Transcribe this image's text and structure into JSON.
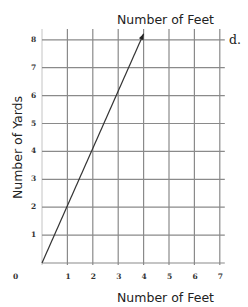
{
  "problem_label": "d.",
  "chart_data": {
    "type": "line",
    "title": "Number of Feet",
    "xlabel": "Number of Feet",
    "ylabel": "Number of Yards",
    "x_ticks": [
      "1",
      "2",
      "3",
      "4",
      "5",
      "6",
      "7"
    ],
    "y_ticks": [
      "0",
      "1",
      "2",
      "3",
      "4",
      "5",
      "6",
      "7",
      "8"
    ],
    "xlim": [
      0,
      7
    ],
    "ylim": [
      0,
      8
    ],
    "grid": true,
    "legend": "none",
    "series": [
      {
        "name": "line",
        "x": [
          0,
          4
        ],
        "y": [
          0,
          8
        ],
        "end_arrow": true
      }
    ],
    "colors": {
      "grid": "#8a8a8a",
      "line": "#333333"
    }
  }
}
